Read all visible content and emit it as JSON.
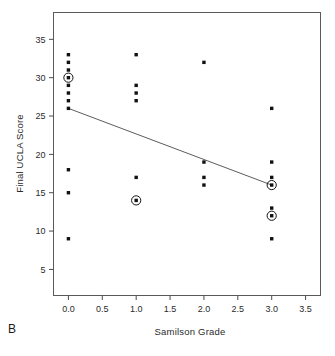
{
  "panel": {
    "letter": "B"
  },
  "chart_data": {
    "type": "scatter",
    "title": "",
    "xlabel": "Samilson Grade",
    "ylabel": "Final UCLA Score",
    "xlim": [
      -0.22,
      3.72
    ],
    "ylim": [
      1.6,
      38.5
    ],
    "xticks": [
      0.0,
      0.5,
      1.0,
      1.5,
      2.0,
      2.5,
      3.0,
      3.5
    ],
    "xticklabels": [
      "0.0",
      "0.5",
      "1.0",
      "1.5",
      "2.0",
      "2.5",
      "3.0",
      "3.5"
    ],
    "yticks": [
      5,
      10,
      15,
      20,
      25,
      30,
      35
    ],
    "yticklabels": [
      "5",
      "10",
      "15",
      "20",
      "25",
      "30",
      "35"
    ],
    "grid": false,
    "legend": null,
    "frame": "box",
    "marker": "filled-square",
    "marker_color": "#111111",
    "highlight_marker": "circled-square",
    "line_color": "#4a4a4a",
    "points": [
      {
        "x": 0,
        "y": 33,
        "highlight": false
      },
      {
        "x": 0,
        "y": 32,
        "highlight": false
      },
      {
        "x": 0,
        "y": 31,
        "highlight": false
      },
      {
        "x": 0,
        "y": 30,
        "highlight": true
      },
      {
        "x": 0,
        "y": 29,
        "highlight": false
      },
      {
        "x": 0,
        "y": 28,
        "highlight": false
      },
      {
        "x": 0,
        "y": 27,
        "highlight": false
      },
      {
        "x": 0,
        "y": 26,
        "highlight": false
      },
      {
        "x": 0,
        "y": 18,
        "highlight": false
      },
      {
        "x": 0,
        "y": 15,
        "highlight": false
      },
      {
        "x": 0,
        "y": 9,
        "highlight": false
      },
      {
        "x": 1,
        "y": 33,
        "highlight": false
      },
      {
        "x": 1,
        "y": 29,
        "highlight": false
      },
      {
        "x": 1,
        "y": 28,
        "highlight": false
      },
      {
        "x": 1,
        "y": 27,
        "highlight": false
      },
      {
        "x": 1,
        "y": 17,
        "highlight": false
      },
      {
        "x": 1,
        "y": 14,
        "highlight": true
      },
      {
        "x": 2,
        "y": 32,
        "highlight": false
      },
      {
        "x": 2,
        "y": 19,
        "highlight": false
      },
      {
        "x": 2,
        "y": 17,
        "highlight": false
      },
      {
        "x": 2,
        "y": 16,
        "highlight": false
      },
      {
        "x": 3,
        "y": 26,
        "highlight": false
      },
      {
        "x": 3,
        "y": 19,
        "highlight": false
      },
      {
        "x": 3,
        "y": 17,
        "highlight": false
      },
      {
        "x": 3,
        "y": 16,
        "highlight": true
      },
      {
        "x": 3,
        "y": 13,
        "highlight": false
      },
      {
        "x": 3,
        "y": 12,
        "highlight": true
      },
      {
        "x": 3,
        "y": 9,
        "highlight": false
      }
    ],
    "fit_line": {
      "x_start": 0.0,
      "y_start": 26.0,
      "x_end": 3.0,
      "y_end": 16.0
    }
  }
}
